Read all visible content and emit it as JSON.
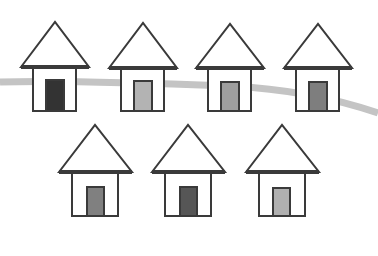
{
  "scene": {
    "width": 378,
    "height": 256,
    "background": "#ffffff",
    "stroke_color": "#3a3a3a",
    "road": {
      "color": "#c4c4c4",
      "width": 7,
      "path": "M0,82 C60,80 150,83 230,86 C290,89 340,100 378,113"
    },
    "houses": [
      {
        "id": "house-1",
        "row": "top",
        "apex": [
          55,
          22
        ],
        "roof_left": 21,
        "roof_right": 89,
        "roof_base_y": 67,
        "wall_left": 33,
        "wall_right": 76,
        "wall_bottom": 111,
        "door": {
          "x": 46,
          "y": 80,
          "w": 18,
          "h": 31,
          "color": "#333333"
        }
      },
      {
        "id": "house-2",
        "row": "top",
        "apex": [
          143,
          23
        ],
        "roof_left": 109,
        "roof_right": 177,
        "roof_base_y": 68,
        "wall_left": 121,
        "wall_right": 164,
        "wall_bottom": 111,
        "door": {
          "x": 134,
          "y": 81,
          "w": 18,
          "h": 30,
          "color": "#b3b3b3"
        }
      },
      {
        "id": "house-3",
        "row": "top",
        "apex": [
          230,
          24
        ],
        "roof_left": 196,
        "roof_right": 264,
        "roof_base_y": 68,
        "wall_left": 208,
        "wall_right": 251,
        "wall_bottom": 111,
        "door": {
          "x": 221,
          "y": 82,
          "w": 18,
          "h": 29,
          "color": "#9e9e9e"
        }
      },
      {
        "id": "house-4",
        "row": "top",
        "apex": [
          318,
          24
        ],
        "roof_left": 284,
        "roof_right": 352,
        "roof_base_y": 68,
        "wall_left": 296,
        "wall_right": 339,
        "wall_bottom": 111,
        "door": {
          "x": 309,
          "y": 82,
          "w": 18,
          "h": 29,
          "color": "#7e7e7e"
        }
      },
      {
        "id": "house-5",
        "row": "bottom",
        "apex": [
          95,
          125
        ],
        "roof_left": 59,
        "roof_right": 132,
        "roof_base_y": 172,
        "wall_left": 72,
        "wall_right": 118,
        "wall_bottom": 216,
        "door": {
          "x": 87,
          "y": 187,
          "w": 17,
          "h": 29,
          "color": "#808080"
        }
      },
      {
        "id": "house-6",
        "row": "bottom",
        "apex": [
          188,
          125
        ],
        "roof_left": 152,
        "roof_right": 225,
        "roof_base_y": 172,
        "wall_left": 165,
        "wall_right": 211,
        "wall_bottom": 216,
        "door": {
          "x": 180,
          "y": 187,
          "w": 17,
          "h": 29,
          "color": "#565656"
        }
      },
      {
        "id": "house-7",
        "row": "bottom",
        "apex": [
          282,
          125
        ],
        "roof_left": 246,
        "roof_right": 319,
        "roof_base_y": 172,
        "wall_left": 259,
        "wall_right": 305,
        "wall_bottom": 216,
        "door": {
          "x": 273,
          "y": 188,
          "w": 17,
          "h": 28,
          "color": "#b0b0b0"
        }
      }
    ]
  }
}
